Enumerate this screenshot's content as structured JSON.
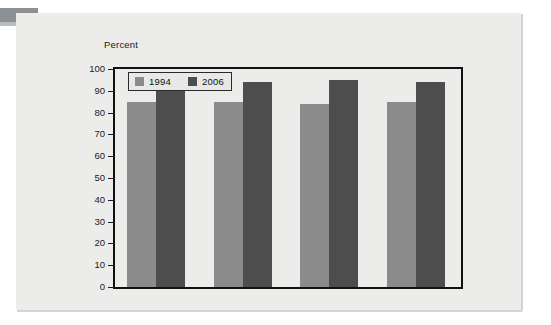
{
  "figure": {
    "axis_title": "Percent"
  },
  "chart_data": {
    "type": "bar",
    "title": "",
    "subtitle": "",
    "xlabel": "",
    "ylabel": "Percent",
    "categories": [
      "Glass",
      "Paper",
      "Plastic",
      "Metal cans"
    ],
    "series": [
      {
        "name": "1994",
        "color": "#8b8b8b",
        "values": [
          85,
          85,
          84,
          85
        ]
      },
      {
        "name": "2006",
        "color": "#4d4d4d",
        "values": [
          95,
          94,
          95,
          94
        ]
      }
    ],
    "ylim": [
      0,
      100
    ],
    "ytick_labels": [
      "100",
      "90",
      "80",
      "70",
      "60",
      "50",
      "40",
      "30",
      "20",
      "10",
      "0"
    ],
    "ytick_values": [
      100,
      90,
      80,
      70,
      60,
      50,
      40,
      30,
      20,
      10,
      0
    ],
    "grid": false,
    "legend_position": "top-left",
    "legend_entries": [
      "1994",
      "2006"
    ]
  }
}
